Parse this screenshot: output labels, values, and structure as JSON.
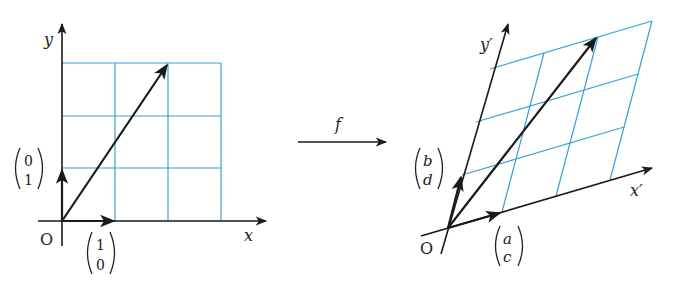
{
  "left": {
    "axis_x_label": "x",
    "axis_y_label": "y",
    "origin_label": "O",
    "basis_e1": [
      "1",
      "0"
    ],
    "basis_e2": [
      "0",
      "1"
    ]
  },
  "map": {
    "label": "f"
  },
  "right": {
    "axis_x_label": "x′",
    "axis_y_label": "y′",
    "origin_label": "O",
    "basis_e1": [
      "a",
      "c"
    ],
    "basis_e2": [
      "b",
      "d"
    ]
  },
  "colors": {
    "grid": "#3aa0d8",
    "ink": "#1a1a1a"
  }
}
